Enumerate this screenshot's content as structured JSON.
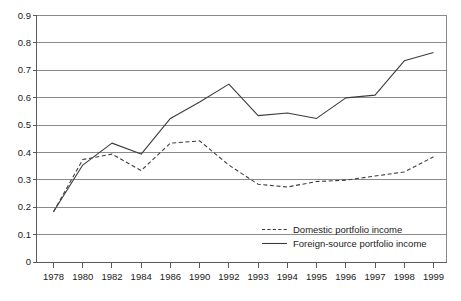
{
  "chart_data": {
    "type": "line",
    "title": "",
    "subtitle": "",
    "xlabel": "",
    "ylabel": "",
    "grid": true,
    "legend_position": "bottom-right",
    "ylim": [
      0,
      0.9
    ],
    "ytick_labels": [
      "0.9",
      "0.8",
      "0.7",
      "0.6",
      "0.5",
      "0.4",
      "0.3",
      "0.2",
      "0.1",
      "0"
    ],
    "ytick_values": [
      0.9,
      0.8,
      0.7,
      0.6,
      0.5,
      0.4,
      0.3,
      0.2,
      0.1,
      0
    ],
    "categories": [
      "1978",
      "1980",
      "1982",
      "1984",
      "1986",
      "1990",
      "1992",
      "1993",
      "1994",
      "1995",
      "1996",
      "1997",
      "1998",
      "1999"
    ],
    "series": [
      {
        "name": "Domestic portfolio income",
        "style": "dashed",
        "color": "#3c3c3c",
        "values": [
          0.185,
          0.375,
          0.395,
          0.335,
          0.435,
          0.443,
          0.355,
          0.285,
          0.275,
          0.295,
          0.3,
          0.315,
          0.33,
          0.385
        ]
      },
      {
        "name": "Foreign-source portfolio income",
        "style": "solid",
        "color": "#3c3c3c",
        "values": [
          0.185,
          0.355,
          0.435,
          0.395,
          0.525,
          0.585,
          0.65,
          0.535,
          0.545,
          0.525,
          0.6,
          0.61,
          0.735,
          0.765
        ]
      }
    ],
    "legend": [
      {
        "label": "Domestic portfolio income",
        "style": "dashed"
      },
      {
        "label": "Foreign-source portfolio income",
        "style": "solid"
      }
    ]
  },
  "colors": {
    "background": "#ffffff",
    "gridline": "#8a8a8a",
    "axis": "#5a5a5a",
    "series": "#3c3c3c",
    "text": "#1a1a1a"
  }
}
